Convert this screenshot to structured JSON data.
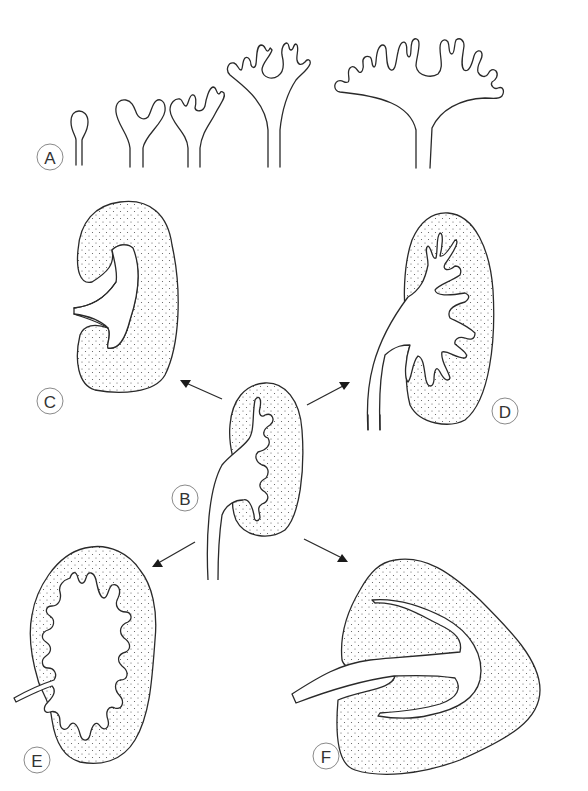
{
  "figure": {
    "colors": {
      "line": "#2a2a2a",
      "stipple": "#555555",
      "background": "#ffffff",
      "label_circle": "#8a8a8a"
    },
    "panels": [
      {
        "id": "A",
        "label": "A",
        "content": "ureteric-bud-branching-sequence"
      },
      {
        "id": "B",
        "label": "B",
        "content": "developing-kidney-center"
      },
      {
        "id": "C",
        "label": "C",
        "content": "unipapillary-kidney"
      },
      {
        "id": "D",
        "label": "D",
        "content": "kidney-with-pelvic-recesses"
      },
      {
        "id": "E",
        "label": "E",
        "content": "multilobar-kidney"
      },
      {
        "id": "F",
        "label": "F",
        "content": "crest-kidney"
      }
    ],
    "arrows": [
      {
        "from": "B",
        "to": "C"
      },
      {
        "from": "B",
        "to": "D"
      },
      {
        "from": "B",
        "to": "E"
      },
      {
        "from": "B",
        "to": "F"
      }
    ]
  }
}
